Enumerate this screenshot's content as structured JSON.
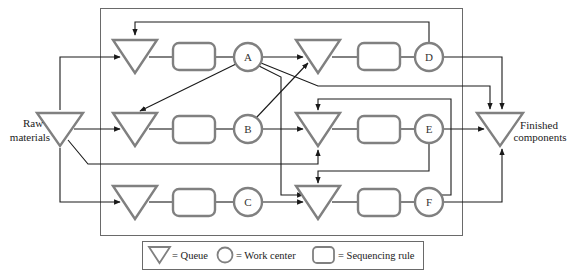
{
  "diagram": {
    "raw_label_line1": "Raw",
    "raw_label_line2": "materials",
    "finished_label_line1": "Finished",
    "finished_label_line2": "components",
    "work_centers": {
      "a": "A",
      "b": "B",
      "c": "C",
      "d": "D",
      "e": "E",
      "f": "F"
    }
  },
  "legend": {
    "queue_label": "= Queue",
    "work_center_label": "= Work center",
    "sequencing_rule_label": "= Sequencing rule"
  },
  "colors": {
    "shape_stroke": "#7a7a7a",
    "line": "#1a1a1a",
    "frame": "#555555"
  }
}
